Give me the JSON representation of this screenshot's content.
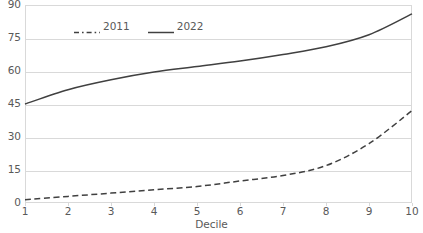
{
  "chart_data": {
    "type": "line",
    "title": "",
    "xlabel": "Decile",
    "ylabel": "",
    "x": [
      1,
      2,
      3,
      4,
      5,
      6,
      7,
      8,
      9,
      10
    ],
    "xtick_labels": [
      "1",
      "2",
      "3",
      "4",
      "5",
      "6",
      "7",
      "8",
      "9",
      "10"
    ],
    "ytick_labels": [
      "0",
      "15",
      "30",
      "45",
      "60",
      "75",
      "90"
    ],
    "yticks": [
      0,
      15,
      30,
      45,
      60,
      75,
      90
    ],
    "xlim": [
      1,
      10
    ],
    "ylim": [
      0,
      90
    ],
    "grid": "horizontal",
    "legend_position": "top-left-inside",
    "series": [
      {
        "name": "2011",
        "style": "dashed",
        "color": "#404040",
        "values": [
          1.5,
          3.0,
          4.5,
          6.0,
          7.5,
          10.0,
          12.5,
          17.0,
          27.0,
          42.0
        ]
      },
      {
        "name": "2022",
        "style": "solid",
        "color": "#404040",
        "values": [
          45.0,
          51.5,
          56.0,
          59.5,
          62.0,
          64.5,
          67.5,
          71.0,
          76.5,
          86.0
        ]
      }
    ]
  },
  "legend": {
    "items": [
      {
        "label": "2011"
      },
      {
        "label": "2022"
      }
    ]
  },
  "colors": {
    "line": "#404040",
    "grid": "#d9d9d9",
    "text": "#595959",
    "background": "#ffffff"
  }
}
